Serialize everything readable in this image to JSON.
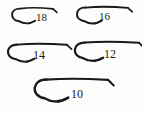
{
  "figure": {
    "background_color": "#fdfdfc",
    "ink_color": "#1a1a1a",
    "width": 142,
    "height": 114,
    "item_count": 5
  },
  "chart_data": {
    "type": "table",
    "xlabel": "",
    "ylabel": "",
    "categories": [
      "18",
      "16",
      "14",
      "12",
      "10"
    ],
    "values": [
      40,
      50,
      58,
      68,
      80
    ],
    "series": [
      {
        "name": "relative hook length (px)",
        "values": [
          40,
          50,
          58,
          68,
          80
        ]
      }
    ],
    "annotations": [
      "Larger hook size number means smaller hook",
      "Each hook drawn to relative scale"
    ],
    "legend_position": "none",
    "grid": false
  },
  "hooks": [
    {
      "id": "hook-18",
      "label": "18",
      "size_number": "18",
      "row": 1,
      "column": "left",
      "left": 13,
      "top": 8,
      "shank_length": 40,
      "bend_depth": 13,
      "stroke_width": 1.7,
      "label_left": 36,
      "label_top": 12,
      "label_size": 11
    },
    {
      "id": "hook-16",
      "label": "16",
      "size_number": "16",
      "row": 1,
      "column": "right",
      "left": 78,
      "top": 7,
      "shank_length": 50,
      "bend_depth": 14,
      "stroke_width": 1.8,
      "label_left": 99,
      "label_top": 11,
      "label_size": 11
    },
    {
      "id": "hook-14",
      "label": "14",
      "size_number": "14",
      "row": 2,
      "column": "left",
      "left": 9,
      "top": 44,
      "shank_length": 58,
      "bend_depth": 15,
      "stroke_width": 1.9,
      "label_left": 33,
      "label_top": 49,
      "label_size": 12
    },
    {
      "id": "hook-12",
      "label": "12",
      "size_number": "12",
      "row": 2,
      "column": "right",
      "left": 76,
      "top": 42,
      "shank_length": 63,
      "bend_depth": 16,
      "stroke_width": 2.0,
      "label_left": 104,
      "label_top": 48,
      "label_size": 12
    },
    {
      "id": "hook-10",
      "label": "10",
      "size_number": "10",
      "row": 3,
      "column": "center",
      "left": 36,
      "top": 79,
      "shank_length": 72,
      "bend_depth": 19,
      "stroke_width": 2.2,
      "label_left": 71,
      "label_top": 88,
      "label_size": 12
    }
  ]
}
